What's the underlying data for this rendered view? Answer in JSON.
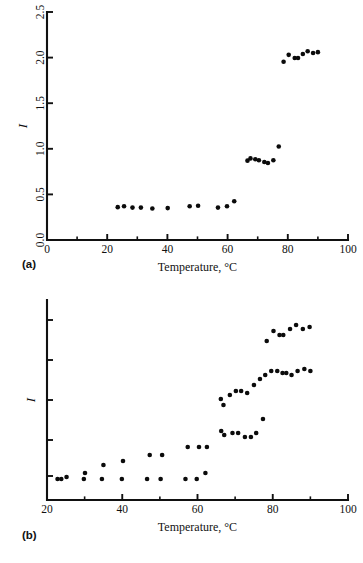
{
  "figure": {
    "panels": [
      {
        "id": "a",
        "label": "(a)"
      },
      {
        "id": "b",
        "label": "(b)"
      }
    ]
  },
  "chart_data": [
    {
      "type": "scatter",
      "panel": "(a)",
      "title": "",
      "xlabel": "Temperature, °C",
      "ylabel": "I",
      "xlim": [
        0,
        100
      ],
      "ylim": [
        0.0,
        2.5
      ],
      "xticks": [
        0,
        20,
        40,
        60,
        80,
        100
      ],
      "xtick_labels": [
        "0",
        "20",
        "40",
        "60",
        "80",
        "100"
      ],
      "xminor_ticks": [
        10,
        30,
        50,
        70,
        90
      ],
      "yticks": [
        0.0,
        0.5,
        1.0,
        1.5,
        2.0,
        2.5
      ],
      "ytick_labels": [
        "0.0",
        "0.5",
        "1.0",
        "1.5",
        "2.0",
        "2.5"
      ],
      "grid": false,
      "legend": false,
      "series": [
        {
          "name": "I",
          "points": [
            [
              23.5,
              0.36
            ],
            [
              25.6,
              0.37
            ],
            [
              28.4,
              0.355
            ],
            [
              31.2,
              0.355
            ],
            [
              35.0,
              0.345
            ],
            [
              40.1,
              0.35
            ],
            [
              47.4,
              0.37
            ],
            [
              50.2,
              0.375
            ],
            [
              56.8,
              0.355
            ],
            [
              59.8,
              0.37
            ],
            [
              62.2,
              0.425
            ],
            [
              66.6,
              0.87
            ],
            [
              67.6,
              0.895
            ],
            [
              69.2,
              0.885
            ],
            [
              70.4,
              0.875
            ],
            [
              72.2,
              0.855
            ],
            [
              73.4,
              0.845
            ],
            [
              75.2,
              0.875
            ],
            [
              77.0,
              1.025
            ],
            [
              78.6,
              1.955
            ],
            [
              80.3,
              2.03
            ],
            [
              82.3,
              1.995
            ],
            [
              83.4,
              1.995
            ],
            [
              85.0,
              2.04
            ],
            [
              86.6,
              2.07
            ],
            [
              88.4,
              2.05
            ],
            [
              90.0,
              2.06
            ]
          ]
        }
      ]
    },
    {
      "type": "scatter",
      "panel": "(b)",
      "title": "",
      "xlabel": "Temperature, °C",
      "ylabel": "I",
      "xlim": [
        20,
        100
      ],
      "ylim": [
        0.0,
        1.0
      ],
      "xticks": [
        20,
        40,
        60,
        80,
        100
      ],
      "xtick_labels": [
        "20",
        "40",
        "60",
        "80",
        "100"
      ],
      "xminor_ticks": [
        30,
        50,
        70,
        90
      ],
      "yticks": [
        0.12,
        0.3,
        0.5,
        0.7,
        0.9
      ],
      "ytick_labels": [
        "",
        "",
        "",
        "",
        ""
      ],
      "grid": false,
      "legend": false,
      "series": [
        {
          "name": "lower-branch",
          "points": [
            [
              22.8,
              0.105
            ],
            [
              23.8,
              0.105
            ],
            [
              25.2,
              0.115
            ],
            [
              29.8,
              0.105
            ],
            [
              30.1,
              0.135
            ],
            [
              34.6,
              0.105
            ],
            [
              35.0,
              0.175
            ],
            [
              39.9,
              0.105
            ],
            [
              40.2,
              0.195
            ],
            [
              46.6,
              0.105
            ],
            [
              47.3,
              0.225
            ],
            [
              50.2,
              0.105
            ],
            [
              50.6,
              0.225
            ],
            [
              56.8,
              0.105
            ],
            [
              57.4,
              0.265
            ],
            [
              59.8,
              0.105
            ],
            [
              60.4,
              0.265
            ],
            [
              62.1,
              0.135
            ],
            [
              62.5,
              0.265
            ],
            [
              66.3,
              0.345
            ],
            [
              67.1,
              0.325
            ],
            [
              69.3,
              0.335
            ],
            [
              70.8,
              0.335
            ],
            [
              72.6,
              0.315
            ],
            [
              74.2,
              0.315
            ],
            [
              75.6,
              0.335
            ],
            [
              77.4,
              0.405
            ]
          ]
        },
        {
          "name": "upper-branch",
          "points": [
            [
              66.2,
              0.505
            ],
            [
              66.9,
              0.475
            ],
            [
              68.6,
              0.525
            ],
            [
              70.2,
              0.545
            ],
            [
              71.6,
              0.545
            ],
            [
              73.2,
              0.535
            ],
            [
              75.0,
              0.575
            ],
            [
              76.6,
              0.605
            ],
            [
              78.0,
              0.625
            ],
            [
              79.6,
              0.645
            ],
            [
              81.2,
              0.645
            ],
            [
              82.6,
              0.635
            ],
            [
              83.6,
              0.635
            ],
            [
              85.0,
              0.625
            ],
            [
              86.6,
              0.645
            ],
            [
              88.4,
              0.655
            ],
            [
              90.0,
              0.645
            ],
            [
              78.4,
              0.795
            ],
            [
              80.2,
              0.845
            ],
            [
              81.8,
              0.825
            ],
            [
              82.8,
              0.825
            ],
            [
              84.6,
              0.855
            ],
            [
              86.2,
              0.875
            ],
            [
              88.0,
              0.855
            ],
            [
              89.8,
              0.865
            ]
          ]
        }
      ]
    }
  ]
}
